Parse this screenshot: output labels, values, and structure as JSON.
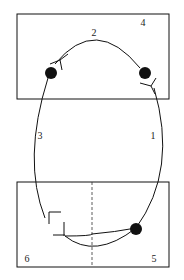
{
  "diagram": {
    "labels": {
      "arc_right": "1",
      "arc_top": "2",
      "arc_left": "3",
      "box_top": "4",
      "box_bottom_right": "5",
      "box_bottom_left": "6"
    },
    "colors": {
      "stroke": "#111111",
      "background": "#ffffff"
    }
  }
}
